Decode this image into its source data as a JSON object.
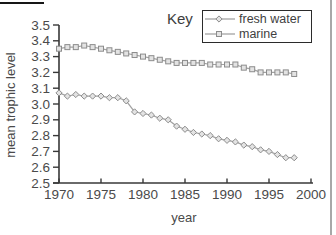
{
  "figure": {
    "key_label": "Key"
  },
  "chart_data": {
    "type": "line",
    "title": "Key",
    "xlabel": "year",
    "ylabel": "mean trophic level",
    "xlim": [
      1970,
      2000
    ],
    "ylim": [
      2.5,
      3.5
    ],
    "grid": false,
    "legend_position": "top-right-boxed",
    "x_ticks": [
      1970,
      1975,
      1980,
      1985,
      1990,
      1995,
      2000
    ],
    "y_ticks": [
      "3.5",
      "3.4",
      "3.3",
      "3.2",
      "3.1",
      "3.0",
      "2.9",
      "2.8",
      "2.7",
      "2.6",
      "2.5"
    ],
    "x": [
      1970,
      1971,
      1972,
      1973,
      1974,
      1975,
      1976,
      1977,
      1978,
      1979,
      1980,
      1981,
      1982,
      1983,
      1984,
      1985,
      1986,
      1987,
      1988,
      1989,
      1990,
      1991,
      1992,
      1993,
      1994,
      1995,
      1996,
      1997,
      1998
    ],
    "series": [
      {
        "name": "fresh water",
        "marker": "diamond",
        "values": [
          3.07,
          3.05,
          3.06,
          3.05,
          3.05,
          3.05,
          3.04,
          3.04,
          3.02,
          2.95,
          2.94,
          2.93,
          2.91,
          2.9,
          2.86,
          2.84,
          2.82,
          2.81,
          2.8,
          2.78,
          2.77,
          2.76,
          2.74,
          2.73,
          2.71,
          2.7,
          2.68,
          2.66,
          2.66
        ]
      },
      {
        "name": "marine",
        "marker": "square",
        "values": [
          3.35,
          3.36,
          3.36,
          3.37,
          3.36,
          3.35,
          3.34,
          3.33,
          3.32,
          3.31,
          3.3,
          3.29,
          3.28,
          3.27,
          3.26,
          3.26,
          3.26,
          3.26,
          3.25,
          3.25,
          3.25,
          3.25,
          3.23,
          3.22,
          3.2,
          3.2,
          3.2,
          3.2,
          3.19
        ]
      }
    ],
    "colors": {
      "line": "#a2a2a2",
      "marker_fill": "#e3e3e3",
      "marker_stroke": "#8c8c8c",
      "axis": "#383838",
      "tick_text": "#4a4a4a"
    }
  }
}
